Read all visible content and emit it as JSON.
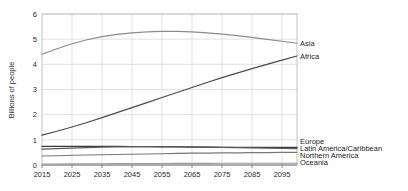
{
  "chart_data": {
    "type": "line",
    "title": "",
    "xlabel": "",
    "ylabel": "Billions of people",
    "xlim": [
      2015,
      2100
    ],
    "ylim": [
      0,
      6
    ],
    "grid": true,
    "legend_position": "right-of-plot-inline",
    "x_ticks": [
      "2015",
      "2025",
      "2035",
      "2045",
      "2055",
      "2065",
      "2075",
      "2085",
      "2095"
    ],
    "x_tick_values": [
      2015,
      2025,
      2035,
      2045,
      2055,
      2065,
      2075,
      2085,
      2095
    ],
    "y_ticks": [
      "0",
      "1",
      "2",
      "3",
      "4",
      "5",
      "6"
    ],
    "y_tick_values": [
      0,
      1,
      2,
      3,
      4,
      5,
      6
    ],
    "x": [
      2015,
      2020,
      2025,
      2030,
      2035,
      2040,
      2045,
      2050,
      2055,
      2060,
      2065,
      2070,
      2075,
      2080,
      2085,
      2090,
      2095,
      2100
    ],
    "series": [
      {
        "name": "Asia",
        "color": "#8c8c8c",
        "width": 1.1,
        "label_y_value": 4.84,
        "values": [
          4.4,
          4.62,
          4.82,
          4.98,
          5.1,
          5.19,
          5.25,
          5.29,
          5.31,
          5.31,
          5.29,
          5.25,
          5.2,
          5.14,
          5.07,
          4.99,
          4.92,
          4.84
        ]
      },
      {
        "name": "Africa",
        "color": "#4a4a4a",
        "width": 1.2,
        "label_y_value": 4.33,
        "values": [
          1.19,
          1.34,
          1.51,
          1.69,
          1.88,
          2.08,
          2.28,
          2.48,
          2.68,
          2.88,
          3.08,
          3.28,
          3.47,
          3.65,
          3.83,
          4.0,
          4.17,
          4.33
        ]
      },
      {
        "name": "Europe",
        "color": "#3a3a3a",
        "width": 1.2,
        "label_y_value": 0.74,
        "values": [
          0.74,
          0.74,
          0.74,
          0.74,
          0.74,
          0.74,
          0.73,
          0.73,
          0.72,
          0.72,
          0.71,
          0.71,
          0.7,
          0.7,
          0.7,
          0.7,
          0.7,
          0.7
        ]
      },
      {
        "name": "Latin America/Caribbean",
        "color": "#5a5a5a",
        "width": 1.2,
        "label_y_value": 0.65,
        "values": [
          0.63,
          0.65,
          0.67,
          0.69,
          0.71,
          0.72,
          0.73,
          0.73,
          0.73,
          0.73,
          0.72,
          0.71,
          0.7,
          0.69,
          0.68,
          0.67,
          0.66,
          0.65
        ]
      },
      {
        "name": "Northern America",
        "color": "#777777",
        "width": 1.1,
        "label_y_value": 0.5,
        "values": [
          0.36,
          0.37,
          0.39,
          0.4,
          0.41,
          0.42,
          0.43,
          0.44,
          0.45,
          0.46,
          0.47,
          0.47,
          0.48,
          0.48,
          0.49,
          0.49,
          0.5,
          0.5
        ]
      },
      {
        "name": "Oceania",
        "color": "#9a9a9a",
        "width": 1.1,
        "label_y_value": 0.07,
        "values": [
          0.04,
          0.042,
          0.045,
          0.048,
          0.051,
          0.054,
          0.057,
          0.059,
          0.061,
          0.063,
          0.065,
          0.066,
          0.067,
          0.068,
          0.069,
          0.07,
          0.07,
          0.071
        ]
      }
    ]
  }
}
